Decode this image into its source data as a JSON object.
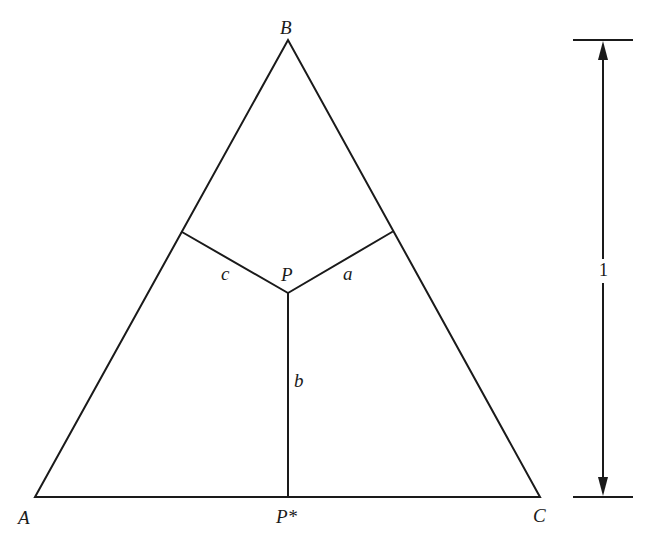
{
  "diagram": {
    "type": "equilateral-triangle-distances",
    "stroke_color": "#1a1a1a",
    "vertices": {
      "A": {
        "label": "A",
        "x": 35,
        "y": 497
      },
      "B": {
        "label": "B",
        "x": 288,
        "y": 40
      },
      "C": {
        "label": "C",
        "x": 540,
        "y": 497
      }
    },
    "point_P": {
      "label": "P",
      "x": 288,
      "y": 293
    },
    "foot_on_base": {
      "label": "P*",
      "x": 288,
      "y": 497
    },
    "foot_on_AB": {
      "x": 182,
      "y": 232
    },
    "foot_on_BC": {
      "x": 392,
      "y": 232
    },
    "segment_labels": {
      "a": "a",
      "b": "b",
      "c": "c"
    },
    "height_indicator": {
      "label": "1",
      "x": 603,
      "top_y": 40,
      "bottom_y": 497
    }
  }
}
